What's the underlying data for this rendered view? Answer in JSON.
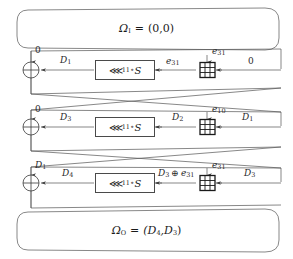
{
  "figure": {
    "type": "differential-characteristic-diagram",
    "rounds": 3,
    "input_box": {
      "text": "Ω₁ = (0,0)",
      "label_main": "Ω",
      "label_sub": "I",
      "value": "(0,0)"
    },
    "output_box": {
      "text": "Ωₒ = (D₄,D₃)",
      "label_main": "Ω",
      "label_sub": "O",
      "value": "(D₄,D₃)"
    },
    "function_box_label": {
      "rotate": "⋘",
      "amount": "11",
      "compose": "∘",
      "sbox": "S"
    },
    "operators": {
      "xor": "⊕",
      "modadd": "⊞"
    }
  },
  "top": {
    "omega": "Ω",
    "omega_sub": "I",
    "eq": "=",
    "value": "(0,0)"
  },
  "bottom": {
    "omega": "Ω",
    "omega_sub": "O",
    "eq": "=",
    "value": "(D",
    "value_sub1": "4",
    "value_mid": ",D",
    "value_sub2": "3",
    "value_end": ")"
  },
  "rounds": [
    {
      "index": 1,
      "xor_top_input": {
        "base": "0",
        "sub": ""
      },
      "left_wire": {
        "base": "D",
        "sub": "1"
      },
      "fbox": {
        "rot": "⋘",
        "amt": "11",
        "compose": "∘",
        "sbox": "S"
      },
      "mid_wire": {
        "base": "e",
        "sub": "31"
      },
      "modadd_top_input": {
        "base": "e",
        "sub": "31"
      },
      "right_wire": {
        "base": "0",
        "sub": ""
      }
    },
    {
      "index": 2,
      "xor_top_input": {
        "base": "0",
        "sub": ""
      },
      "left_wire": {
        "base": "D",
        "sub": "3"
      },
      "fbox": {
        "rot": "⋘",
        "amt": "11",
        "compose": "∘",
        "sbox": "S"
      },
      "mid_wire": {
        "base": "D",
        "sub": "2"
      },
      "modadd_top_input": {
        "base": "e",
        "sub": "10"
      },
      "right_wire": {
        "base": "D",
        "sub": "1"
      }
    },
    {
      "index": 3,
      "xor_top_input": {
        "base": "D",
        "sub": "1"
      },
      "left_wire": {
        "base": "D",
        "sub": "4"
      },
      "fbox": {
        "rot": "⋘",
        "amt": "11",
        "compose": "∘",
        "sbox": "S"
      },
      "mid_wire": {
        "base": "D",
        "sub": "3",
        "op": "⊕",
        "base2": "e",
        "sub2": "31"
      },
      "modadd_top_input": {
        "base": "e",
        "sub": "31"
      },
      "right_wire": {
        "base": "D",
        "sub": "3"
      }
    }
  ]
}
